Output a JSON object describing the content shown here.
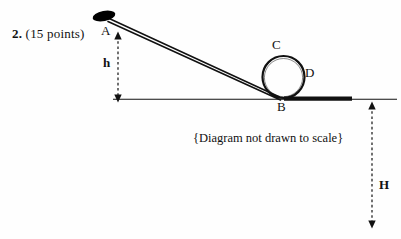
{
  "problem": {
    "number": "2.",
    "points": "(15 points)"
  },
  "caption": {
    "text": "{Diagram not drawn to scale}"
  },
  "diagram": {
    "points": [
      {
        "id": "A",
        "label": "A",
        "role": "top-of-incline"
      },
      {
        "id": "B",
        "label": "B",
        "role": "bottom-of-loop"
      },
      {
        "id": "C",
        "label": "C",
        "role": "top-of-loop"
      },
      {
        "id": "D",
        "label": "D",
        "role": "right-of-loop"
      }
    ],
    "dimensions": [
      {
        "id": "h",
        "label": "h",
        "role": "incline-height"
      },
      {
        "id": "H",
        "label": "H",
        "role": "drop-height"
      }
    ],
    "colors": {
      "ink": "#111111",
      "paper": "#fefefe",
      "block": "#000000"
    }
  }
}
